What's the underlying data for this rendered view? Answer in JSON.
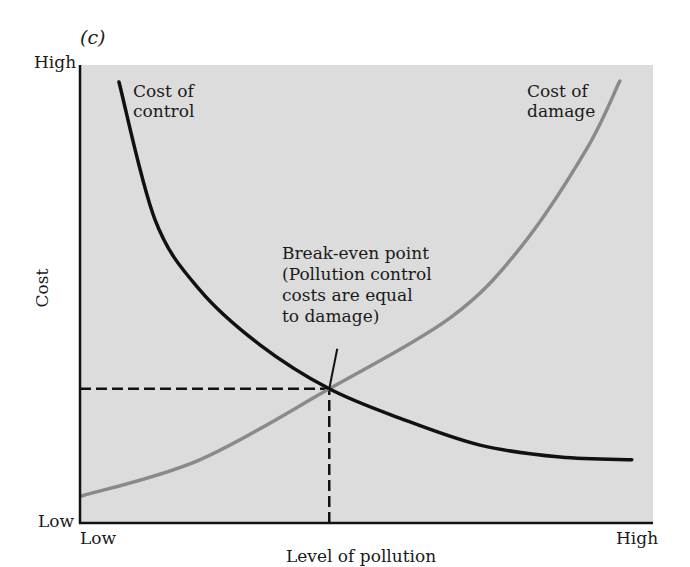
{
  "panel_label": "(c)",
  "chart_data": {
    "type": "line",
    "title": "",
    "xlabel": "Level of pollution",
    "ylabel": "Cost",
    "x_ticks": [
      "Low",
      "High"
    ],
    "y_ticks": [
      "Low",
      "High"
    ],
    "xlim": [
      0,
      100
    ],
    "ylim": [
      0,
      100
    ],
    "grid": false,
    "legend": "inline labels",
    "series": [
      {
        "name": "Cost of control",
        "color": "#111111",
        "points": [
          [
            6.8,
            96.3
          ],
          [
            13.1,
            66.2
          ],
          [
            20.9,
            50.9
          ],
          [
            31.4,
            38.9
          ],
          [
            43.5,
            29.3
          ],
          [
            55.8,
            22.9
          ],
          [
            69.8,
            17.0
          ],
          [
            83.8,
            14.4
          ],
          [
            96.3,
            13.8
          ]
        ]
      },
      {
        "name": "Cost of damage",
        "color": "#8a8a8a",
        "points": [
          [
            0.3,
            5.9
          ],
          [
            20.9,
            13.8
          ],
          [
            43.5,
            29.3
          ],
          [
            64.6,
            44.8
          ],
          [
            76.8,
            60.0
          ],
          [
            88.3,
            81.4
          ],
          [
            94.2,
            96.5
          ]
        ]
      }
    ],
    "annotations": [
      {
        "text": "Break-even point (Pollution control costs are equal to damage)",
        "lines": [
          "Break-even point",
          "(Pollution control",
          "costs are equal",
          "to damage)"
        ],
        "point": [
          43.5,
          29.3
        ]
      }
    ],
    "reference_lines": [
      {
        "type": "horizontal-dashed",
        "y": 29.3,
        "x_from": 0,
        "x_to": 43.5
      },
      {
        "type": "vertical-dashed",
        "x": 43.5,
        "y_from": 0,
        "y_to": 29.3
      }
    ]
  },
  "labels": {
    "y_high": "High",
    "y_low": "Low",
    "x_low": "Low",
    "x_high": "High",
    "ylabel": "Cost",
    "xlabel": "Level of pollution",
    "control_line1": "Cost of",
    "control_line2": "control",
    "damage_line1": "Cost of",
    "damage_line2": "damage",
    "annot_1": "Break-even point",
    "annot_2": "(Pollution control",
    "annot_3": "costs are equal",
    "annot_4": "to damage)"
  },
  "colors": {
    "plot_background": "#dcdcdc",
    "axis": "#111111",
    "control_curve": "#111111",
    "damage_curve": "#8a8a8a"
  }
}
